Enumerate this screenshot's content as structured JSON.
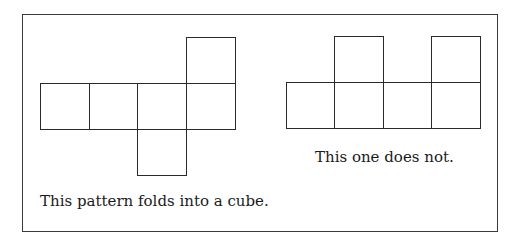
{
  "figure": {
    "border_color": "#3a3a3a",
    "line_color": "#2a2a2a",
    "left_net": {
      "caption": "This pattern folds into a cube.",
      "folds_into_cube": true,
      "squares": [
        {
          "x": 40,
          "y": 83,
          "w": 50,
          "h": 47
        },
        {
          "x": 89,
          "y": 83,
          "w": 49,
          "h": 47
        },
        {
          "x": 137,
          "y": 83,
          "w": 50,
          "h": 47
        },
        {
          "x": 186,
          "y": 83,
          "w": 50,
          "h": 47
        },
        {
          "x": 186,
          "y": 37,
          "w": 50,
          "h": 47
        },
        {
          "x": 137,
          "y": 129,
          "w": 50,
          "h": 47
        }
      ]
    },
    "right_net": {
      "caption": "This one does not.",
      "folds_into_cube": false,
      "squares": [
        {
          "x": 286,
          "y": 82,
          "w": 49,
          "h": 47
        },
        {
          "x": 334,
          "y": 82,
          "w": 50,
          "h": 47
        },
        {
          "x": 383,
          "y": 82,
          "w": 49,
          "h": 47
        },
        {
          "x": 431,
          "y": 82,
          "w": 50,
          "h": 47
        },
        {
          "x": 334,
          "y": 36,
          "w": 50,
          "h": 47
        },
        {
          "x": 431,
          "y": 36,
          "w": 50,
          "h": 47
        }
      ]
    }
  }
}
